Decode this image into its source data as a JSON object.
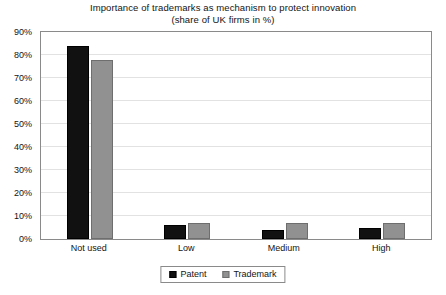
{
  "chart_data": {
    "type": "bar",
    "title": "Importance of trademarks as mechanism to protect innovation",
    "subtitle": "(share of UK firms in %)",
    "xlabel": "",
    "ylabel": "",
    "categories": [
      "Not used",
      "Low",
      "Medium",
      "High"
    ],
    "series": [
      {
        "name": "Patent",
        "color": "#111111",
        "values": [
          84,
          6,
          4,
          5
        ]
      },
      {
        "name": "Trademark",
        "color": "#919191",
        "values": [
          78,
          7,
          7,
          7
        ]
      }
    ],
    "ylim": [
      0,
      90
    ],
    "ytick_values": [
      90,
      80,
      70,
      60,
      50,
      40,
      30,
      20,
      10,
      0
    ],
    "ytick_labels": [
      "90%",
      "80%",
      "70%",
      "60%",
      "50%",
      "40%",
      "30%",
      "20%",
      "10%",
      "0%"
    ],
    "grid": true,
    "grid_axis": "y",
    "legend_position": "bottom",
    "legend_entries": [
      "Patent",
      "Trademark"
    ]
  }
}
